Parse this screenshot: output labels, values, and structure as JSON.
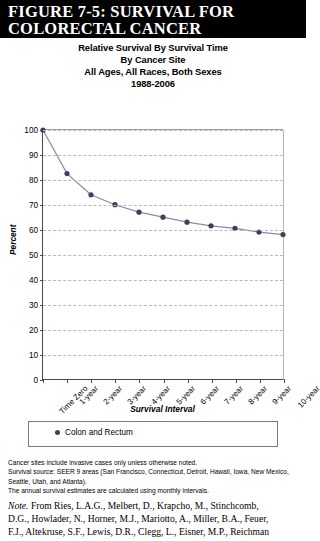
{
  "figure_header": {
    "line1": "FIGURE 7-5: SURVIVAL FOR",
    "line2": "COLORECTAL CANCER"
  },
  "chart_title": {
    "line1": "Relative Survival By Survival Time",
    "line2": "By Cancer Site",
    "line3": "All Ages, All Races, Both Sexes",
    "line4": "1988-2006"
  },
  "axis": {
    "y_title": "Percent",
    "x_title": "Survival Interval"
  },
  "legend": {
    "entries": [
      {
        "label": "Colon and Rectum",
        "color": "#3e3e5e",
        "marker": "diamond-marker"
      }
    ]
  },
  "footnotes": {
    "line1": "Cancer sites include invasive cases only unless otherwise noted.",
    "line2": "Survival source: SEER 9 areas (San Francisco, Connecticut, Detroit, Hawaii, Iowa, New Mexico,",
    "line3": "Seattle, Utah, and Atlanta).",
    "line4": "The annual survival estimates are calculated using monthly intervals."
  },
  "note": {
    "lead": "Note.",
    "line1": " From Ries, L.A.G., Melbert, D., Krapcho, M., Stinchcomb,",
    "line2": "D.G., Howlader, N., Horner, M.J., Mariotto, A., Miller, B.A., Feuer,",
    "line3": "F.J., Altekruse, S.F., Lewis, D.R., Clegg, L., Eisner, M.P., Reichman"
  },
  "chart_data": {
    "type": "line",
    "title": "Relative Survival By Survival Time By Cancer Site All Ages, All Races, Both Sexes 1988-2006",
    "xlabel": "Survival Interval",
    "ylabel": "Percent",
    "ylim": [
      0,
      100
    ],
    "yticks": [
      0,
      10,
      20,
      30,
      40,
      50,
      60,
      70,
      80,
      90,
      100
    ],
    "grid": true,
    "legend_position": "bottom",
    "categories": [
      "Time Zero",
      "1-year",
      "2-year",
      "3-year",
      "4-year",
      "5-year",
      "6-year",
      "7-year",
      "8-year",
      "9-year",
      "10-year"
    ],
    "series": [
      {
        "name": "Colon and Rectum",
        "color": "#3e3e5e",
        "values": [
          100,
          82.5,
          74,
          70,
          67,
          65,
          63,
          61.5,
          60.5,
          59,
          58
        ]
      }
    ]
  }
}
